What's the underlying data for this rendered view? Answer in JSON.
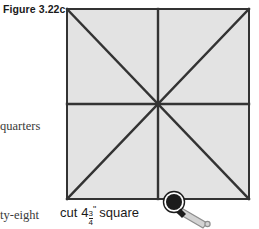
{
  "figure": {
    "label": "Figure 3.22c",
    "caption_word1": "cut",
    "caption_number": "4",
    "fraction_numerator": "3",
    "fraction_denominator": "4",
    "inch_mark": "\"",
    "caption_word2": "square"
  },
  "margin_text": {
    "fragment_1": "quarters",
    "fragment_2": "ty-eight"
  },
  "icons": {
    "pointer": "magnifier-cursor-icon"
  },
  "colors": {
    "square_fill": "#e3e3e3",
    "square_stroke": "#333333",
    "page_background": "#ffffff",
    "text": "#1a1a1a",
    "margin_text": "#3a3a3a",
    "cursor_dark": "#1c1c1c",
    "cursor_light": "#d0d0d0"
  },
  "diagram": {
    "shape": "square",
    "divisions": "eight triangles",
    "lines": [
      "top-left to bottom-right diagonal",
      "top-right to bottom-left diagonal",
      "horizontal midline",
      "vertical midline"
    ]
  }
}
